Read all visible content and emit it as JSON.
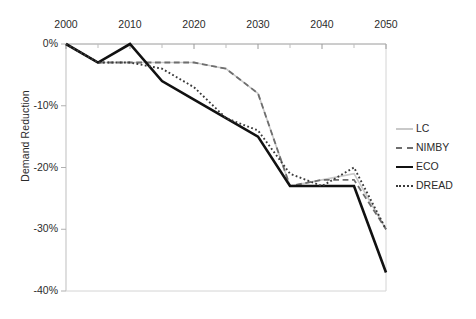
{
  "chart_data": {
    "type": "line",
    "title": "",
    "xlabel": "",
    "ylabel": "Demand Reduction",
    "x": [
      2000,
      2005,
      2010,
      2015,
      2020,
      2025,
      2030,
      2035,
      2040,
      2045,
      2050
    ],
    "xlim": [
      2000,
      2050
    ],
    "ylim": [
      -40,
      0
    ],
    "xticks": [
      "2000",
      "2010",
      "2020",
      "2030",
      "2040",
      "2050"
    ],
    "xtick_values": [
      2000,
      2010,
      2020,
      2030,
      2040,
      2050
    ],
    "yticks": [
      "0%",
      "-10%",
      "-20%",
      "-30%",
      "-40%"
    ],
    "ytick_values": [
      0,
      -10,
      -20,
      -30,
      -40
    ],
    "grid": false,
    "xaxis_position": "top",
    "legend_position": "right",
    "series": [
      {
        "name": "LC",
        "color": "#c9c9c9",
        "style": "solid",
        "width": 1.6,
        "values": [
          0,
          -3,
          -3,
          -3,
          -3,
          -4,
          -8,
          -23,
          -22,
          -21,
          -30
        ]
      },
      {
        "name": "NIMBY",
        "color": "#6e6e6e",
        "style": "dashed",
        "width": 1.8,
        "values": [
          0,
          -3,
          -3,
          -3,
          -3,
          -4,
          -8,
          -23,
          -22,
          -22,
          -30
        ]
      },
      {
        "name": "ECO",
        "color": "#111111",
        "style": "solid",
        "width": 2.6,
        "values": [
          0,
          -3,
          0,
          -6,
          -9,
          -12,
          -15,
          -23,
          -23,
          -23,
          -37
        ]
      },
      {
        "name": "DREAD",
        "color": "#3a3a3a",
        "style": "dotted",
        "width": 1.9,
        "values": [
          0,
          -3,
          -3,
          -4,
          -7,
          -12,
          -14,
          -21,
          -23,
          -20,
          -30
        ]
      }
    ]
  },
  "legend": {
    "items": [
      {
        "label": "LC"
      },
      {
        "label": "NIMBY"
      },
      {
        "label": "ECO"
      },
      {
        "label": "DREAD"
      }
    ]
  },
  "axis": {
    "y_title": "Demand Reduction"
  }
}
